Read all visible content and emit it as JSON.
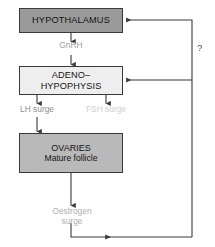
{
  "diagram": {
    "nodes": [
      {
        "id": "hypothalamus",
        "lines": [
          "HYPOTHALAMUS"
        ],
        "fill": "#9a9a9a",
        "stroke": "#3a3a3a"
      },
      {
        "id": "adenohypophysis",
        "lines": [
          "ADENO–",
          "HYPOPHYSIS"
        ],
        "fill": "#eeeeee",
        "stroke": "#3a3a3a"
      },
      {
        "id": "ovaries",
        "lines": [
          "OVARIES",
          "Mature follicle"
        ],
        "fill": "#b9b9b9",
        "stroke": "#3a3a3a"
      }
    ],
    "edge_labels": [
      {
        "id": "gnrh",
        "text": "GnRH",
        "color": "#a0a0a0"
      },
      {
        "id": "lh-surge",
        "text": "LH surge",
        "color": "#8e8e8e"
      },
      {
        "id": "fsh-surge",
        "text": "FSH surge",
        "color": "#cfcfcf"
      },
      {
        "id": "oestrogen-surge-line1",
        "text": "Oestrogen",
        "color": "#b0b0b0"
      },
      {
        "id": "oestrogen-surge-line2",
        "text": "surge",
        "color": "#b0b0b0"
      }
    ],
    "annotations": [
      {
        "id": "question-mark",
        "text": "?",
        "color": "#4a4a4a"
      }
    ],
    "colors": {
      "background": "#ffffff",
      "line": "#3a3a3a",
      "faint_line": "#6e6e6e",
      "hypothalamus_fill": "#9a9a9a",
      "adenohypophysis_fill": "#eeeeee",
      "ovaries_fill": "#b9b9b9"
    }
  }
}
